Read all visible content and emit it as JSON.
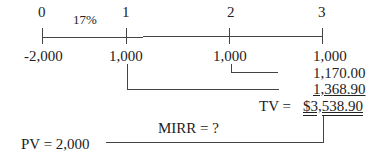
{
  "timeline": {
    "periods": [
      "0",
      "1",
      "2",
      "3"
    ],
    "rate": "17%",
    "cash_flows": [
      "-2,000",
      "1,000",
      "1,000",
      "1,000"
    ]
  },
  "compounding": {
    "fv_values": [
      "1,170.00",
      "1,368.90"
    ],
    "tv_label": "TV =",
    "tv_value": "$3,538.90"
  },
  "result": {
    "mirr_label": "MIRR = ?",
    "pv_label": "PV = 2,000"
  }
}
